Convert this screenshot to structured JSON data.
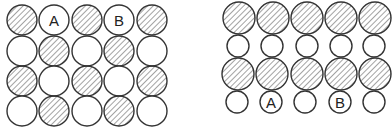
{
  "figure": {
    "colors": {
      "stroke": "#333333",
      "hatch": "#555555",
      "background": "#ffffff"
    },
    "left_grid": {
      "name": "left-arrangement",
      "rows": [
        {
          "y": 20,
          "r": 15,
          "cells": [
            {
              "x": 22,
              "type": "hatched",
              "label": ""
            },
            {
              "x": 54,
              "type": "plain",
              "label": "A"
            },
            {
              "x": 87,
              "type": "hatched",
              "label": ""
            },
            {
              "x": 119,
              "type": "plain",
              "label": "B"
            },
            {
              "x": 152,
              "type": "hatched",
              "label": ""
            }
          ]
        },
        {
          "y": 51,
          "r": 15,
          "cells": [
            {
              "x": 22,
              "type": "plain",
              "label": ""
            },
            {
              "x": 54,
              "type": "hatched",
              "label": ""
            },
            {
              "x": 87,
              "type": "plain",
              "label": ""
            },
            {
              "x": 119,
              "type": "hatched",
              "label": ""
            },
            {
              "x": 152,
              "type": "plain",
              "label": ""
            }
          ]
        },
        {
          "y": 81,
          "r": 15,
          "cells": [
            {
              "x": 22,
              "type": "hatched",
              "label": ""
            },
            {
              "x": 54,
              "type": "plain",
              "label": ""
            },
            {
              "x": 87,
              "type": "hatched",
              "label": ""
            },
            {
              "x": 119,
              "type": "plain",
              "label": ""
            },
            {
              "x": 152,
              "type": "hatched",
              "label": ""
            }
          ]
        },
        {
          "y": 111,
          "r": 15,
          "cells": [
            {
              "x": 22,
              "type": "plain",
              "label": ""
            },
            {
              "x": 54,
              "type": "hatched",
              "label": ""
            },
            {
              "x": 87,
              "type": "plain",
              "label": ""
            },
            {
              "x": 119,
              "type": "hatched",
              "label": ""
            },
            {
              "x": 152,
              "type": "plain",
              "label": ""
            }
          ]
        }
      ]
    },
    "right_grid": {
      "name": "right-arrangement",
      "rows": [
        {
          "y": 18,
          "r": 16,
          "cells": [
            {
              "x": 239,
              "type": "hatched",
              "label": ""
            },
            {
              "x": 273,
              "type": "hatched",
              "label": ""
            },
            {
              "x": 307,
              "type": "hatched",
              "label": ""
            },
            {
              "x": 341,
              "type": "hatched",
              "label": ""
            },
            {
              "x": 375,
              "type": "hatched",
              "label": ""
            }
          ]
        },
        {
          "y": 46,
          "r": 11,
          "cells": [
            {
              "x": 238,
              "type": "plain",
              "label": ""
            },
            {
              "x": 272,
              "type": "plain",
              "label": ""
            },
            {
              "x": 307,
              "type": "plain",
              "label": ""
            },
            {
              "x": 341,
              "type": "plain",
              "label": ""
            },
            {
              "x": 374,
              "type": "plain",
              "label": ""
            }
          ]
        },
        {
          "y": 74,
          "r": 16,
          "cells": [
            {
              "x": 238,
              "type": "hatched",
              "label": ""
            },
            {
              "x": 272,
              "type": "hatched",
              "label": ""
            },
            {
              "x": 307,
              "type": "hatched",
              "label": ""
            },
            {
              "x": 341,
              "type": "hatched",
              "label": ""
            },
            {
              "x": 375,
              "type": "hatched",
              "label": ""
            }
          ]
        },
        {
          "y": 102,
          "r": 11,
          "cells": [
            {
              "x": 237,
              "type": "plain",
              "label": ""
            },
            {
              "x": 271,
              "type": "plain",
              "label": "A"
            },
            {
              "x": 305,
              "type": "plain",
              "label": ""
            },
            {
              "x": 340,
              "type": "plain",
              "label": "B"
            },
            {
              "x": 374,
              "type": "plain",
              "label": ""
            }
          ]
        }
      ]
    }
  }
}
